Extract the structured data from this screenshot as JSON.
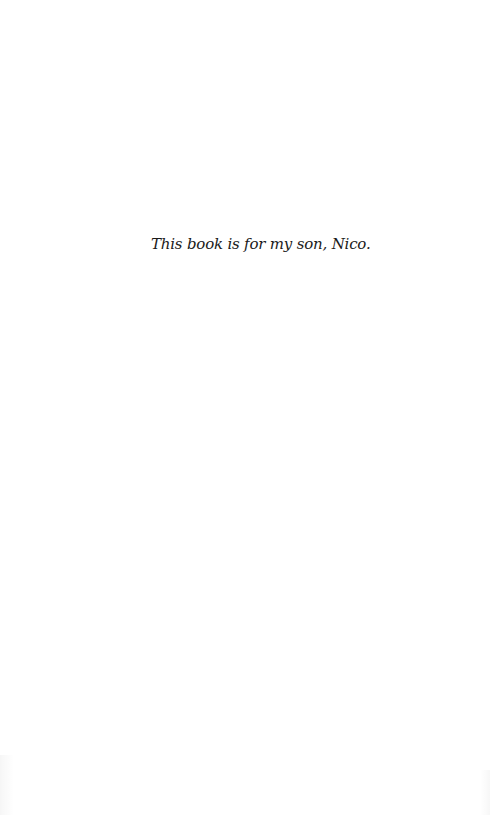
{
  "page": {
    "type": "dedication-page",
    "background_color": "#ffffff",
    "text_color": "#1a1a1a"
  },
  "dedication": {
    "text": "This book is for my son, Nico."
  }
}
